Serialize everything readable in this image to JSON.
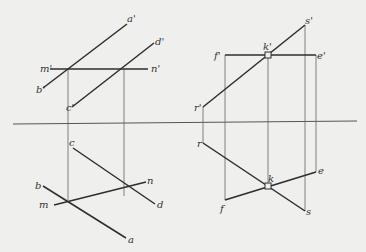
{
  "diagram": {
    "type": "descriptive-geometry-projection",
    "colors": {
      "background": "#efefed",
      "line": "#2e2e2e",
      "projection": "#666666"
    },
    "projection_axis": {
      "x1": 13,
      "y1": 124,
      "x2": 357,
      "y2": 121
    },
    "left_figure": {
      "labels": {
        "a_prime": "a'",
        "b_prime": "b'",
        "c_prime": "c'",
        "d_prime": "d'",
        "m_prime": "m'",
        "n_prime": "n'",
        "a": "a",
        "b": "b",
        "c": "c",
        "d": "d",
        "m": "m",
        "n": "n"
      }
    },
    "right_figure": {
      "labels": {
        "s_prime": "s'",
        "r_prime": "r'",
        "f_prime": "f'",
        "e_prime": "e'",
        "k_prime": "k'",
        "s": "s",
        "r": "r",
        "f": "f",
        "e": "e",
        "k": "k"
      }
    }
  }
}
